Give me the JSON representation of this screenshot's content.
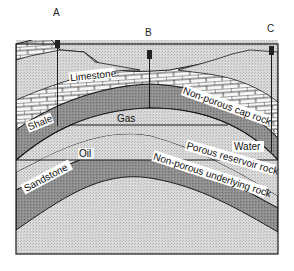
{
  "diagram": {
    "type": "geological cross-section (anticline oil trap)",
    "wells": [
      {
        "id": "A",
        "label": "A",
        "x": 57
      },
      {
        "id": "B",
        "label": "B",
        "x": 149
      },
      {
        "id": "C",
        "label": "C",
        "x": 271
      }
    ],
    "layers": {
      "limestone": "Limestone",
      "shale": "Shale",
      "cap_rock": "Non-porous cap rock",
      "gas": "Gas",
      "oil": "Oil",
      "water": "Water",
      "sandstone": "Sandstone",
      "reservoir": "Porous reservoir rock",
      "underlying": "Non-porous underlying rock"
    },
    "colors": {
      "background": "#ffffff",
      "light_stipple": "#d6d6d6",
      "dark_band": "#8a8a8a",
      "limestone_fill": "#f4f4f4",
      "outline": "#1a1a1a"
    }
  }
}
